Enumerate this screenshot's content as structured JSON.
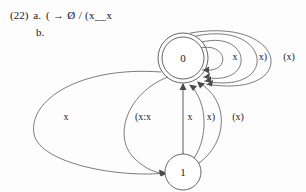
{
  "example": {
    "number": "(22)",
    "items": [
      {
        "letter": "a.",
        "text": "( → Ø / (x__x"
      },
      {
        "letter": "b.",
        "text": ""
      }
    ]
  },
  "diagram": {
    "type": "finite-state-automaton",
    "ink_color": "#4a4a4a",
    "background": "#fdfdfd",
    "nodes": [
      {
        "id": "0",
        "label": "0",
        "cx": 183,
        "cy": 58,
        "r": 21,
        "accepting": true,
        "outer_r": 25
      },
      {
        "id": "1",
        "label": "1",
        "cx": 183,
        "cy": 172,
        "r": 18,
        "accepting": false
      }
    ],
    "edge_labels": [
      {
        "id": "self-loop-x",
        "text": "x",
        "x": 235,
        "y": 58
      },
      {
        "id": "self-loop-xrp",
        "text": "x)",
        "x": 263,
        "y": 58
      },
      {
        "id": "self-loop-pxp",
        "text": "(x)",
        "x": 289,
        "y": 58
      },
      {
        "id": "arc-left-x",
        "text": "x",
        "x": 66,
        "y": 118
      },
      {
        "id": "arc-colon-xx",
        "text": "(x:x",
        "x": 143,
        "y": 118
      },
      {
        "id": "arc-up-x",
        "text": "x",
        "x": 190,
        "y": 118
      },
      {
        "id": "arc-up-xrp",
        "text": "x)",
        "x": 211,
        "y": 118
      },
      {
        "id": "arc-up-pxp",
        "text": "(x)",
        "x": 238,
        "y": 118
      }
    ]
  }
}
